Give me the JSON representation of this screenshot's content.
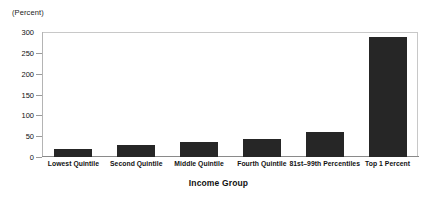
{
  "chart_data": {
    "type": "bar",
    "title": "",
    "unit_label": "(Percent)",
    "xlabel": "Income Group",
    "ylabel": "",
    "categories": [
      "Lowest Quintile",
      "Second Quintile",
      "Middle Quintile",
      "Fourth Quintile",
      "81st–99th Percentiles",
      "Top 1 Percent"
    ],
    "values": [
      19,
      29,
      36,
      44,
      60,
      288
    ],
    "ylim": [
      0,
      300
    ],
    "yticks": [
      0,
      50,
      100,
      150,
      200,
      250,
      300
    ],
    "ytick_labels": [
      "0",
      "50",
      "100",
      "150",
      "200",
      "250",
      "300"
    ],
    "grid": false,
    "legend": false,
    "bar_color": "#262626",
    "frame_color": "#c8c8c8",
    "axis_color": "#8a8a8a",
    "background": "#ffffff"
  }
}
